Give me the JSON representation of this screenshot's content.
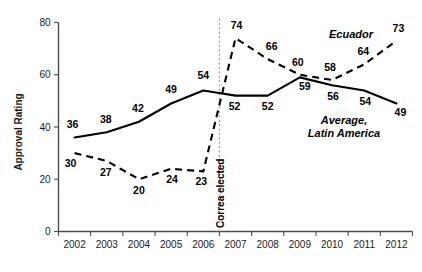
{
  "chart_data": {
    "type": "line",
    "title": "",
    "xlabel": "",
    "ylabel": "Approval Rating",
    "ylim": [
      0,
      80
    ],
    "yticks": [
      0,
      20,
      40,
      60,
      80
    ],
    "grid": false,
    "legend_position": "inline-annotation",
    "categories": [
      "2002",
      "2003",
      "2004",
      "2005",
      "2006",
      "2007",
      "2008",
      "2009",
      "2010",
      "2011",
      "2012"
    ],
    "series": [
      {
        "name": "Average, Latin America",
        "style": "solid",
        "values": [
          36,
          38,
          42,
          49,
          54,
          52,
          52,
          59,
          56,
          54,
          49
        ]
      },
      {
        "name": "Ecuador",
        "style": "dashed",
        "values": [
          30,
          27,
          20,
          24,
          23,
          74,
          66,
          60,
          58,
          64,
          73
        ]
      }
    ],
    "annotations": [
      {
        "text": "Correa elected",
        "type": "vertical-dotted-line",
        "x_position": "between 2006 and 2007",
        "orientation": "vertical"
      }
    ]
  },
  "axes": {
    "y_title": "Approval Rating",
    "y_ticks": [
      "0",
      "20",
      "40",
      "60",
      "80"
    ],
    "x_ticks": [
      "2002",
      "2003",
      "2004",
      "2005",
      "2006",
      "2007",
      "2008",
      "2009",
      "2010",
      "2011",
      "2012"
    ]
  },
  "series_labels": {
    "ecuador": "Ecuador",
    "average_line1": "Average,",
    "average_line2": "Latin America"
  },
  "event": {
    "label": "Correa elected"
  },
  "point_labels": {
    "average": [
      "36",
      "38",
      "42",
      "49",
      "54",
      "52",
      "52",
      "59",
      "56",
      "54",
      "49"
    ],
    "ecuador": [
      "30",
      "27",
      "20",
      "24",
      "23",
      "74",
      "66",
      "60",
      "58",
      "64",
      "73"
    ]
  }
}
